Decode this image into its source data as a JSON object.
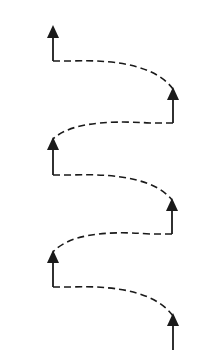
{
  "diagram": {
    "type": "helix-arrow-path",
    "width": 212,
    "height": 364,
    "stroke_color": "#1a1a1a",
    "background": "#ffffff",
    "dash_pattern": "7 4",
    "arrows": [
      {
        "x": 173,
        "tip_y": 313,
        "base_y": 350,
        "side": "right"
      },
      {
        "x": 53,
        "tip_y": 250,
        "base_y": 287,
        "side": "left"
      },
      {
        "x": 172,
        "tip_y": 198,
        "base_y": 234,
        "side": "right"
      },
      {
        "x": 53,
        "tip_y": 137,
        "base_y": 175,
        "side": "left"
      },
      {
        "x": 173,
        "tip_y": 87,
        "base_y": 123,
        "side": "right"
      },
      {
        "x": 53,
        "tip_y": 25,
        "base_y": 61,
        "side": "left"
      }
    ],
    "connectors": [
      {
        "style": "dashed",
        "path": "M53 287 L70 287 Q150 284 173 316"
      },
      {
        "style": "dashed",
        "path": "M172 234 L150 234 Q75 228 53 252"
      },
      {
        "style": "dashed",
        "path": "M53 175 L70 175 Q150 172 172 200"
      },
      {
        "style": "dashed",
        "path": "M173 123 L150 123 Q75 118 53 139"
      },
      {
        "style": "dashed",
        "path": "M53 61 L70 61 Q150 58 173 89"
      }
    ]
  }
}
